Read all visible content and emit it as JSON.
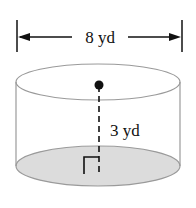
{
  "figure": {
    "shape": "cylinder",
    "diameter_label": "8 yd",
    "height_label": "3 yd",
    "colors": {
      "stroke": "#9a9a9a",
      "base_fill": "#dcdcdc",
      "ink": "#111111"
    }
  }
}
